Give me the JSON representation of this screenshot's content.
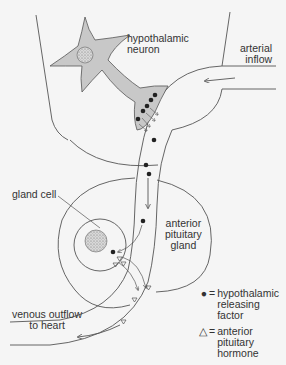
{
  "diagram": {
    "colors": {
      "background": "#f5f5f5",
      "stroke": "#555555",
      "neuron_fill": "#c8c8c8",
      "dot": "#222222"
    },
    "labels": {
      "hypothalamic_neuron": [
        "hypothalamic",
        "neuron"
      ],
      "arterial_inflow": [
        "arterial",
        "inflow"
      ],
      "gland_cell": "gland cell",
      "anterior_pituitary_gland": [
        "anterior",
        "pituitary",
        "gland"
      ],
      "venous_outflow": [
        "venous outflow",
        "to heart"
      ]
    },
    "legend": {
      "items": [
        {
          "symbol": "●",
          "eq": "=",
          "lines": [
            "hypothalamic",
            "releasing",
            "factor"
          ]
        },
        {
          "symbol": "△",
          "eq": "=",
          "lines": [
            "anterior",
            "pituitary",
            "hormone"
          ]
        }
      ]
    }
  }
}
